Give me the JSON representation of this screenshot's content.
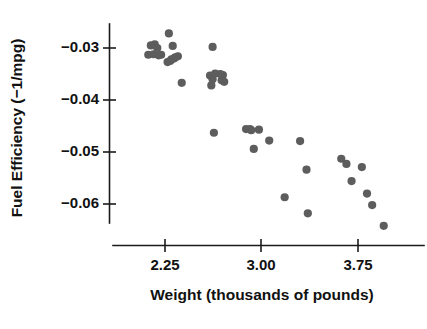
{
  "chart_data": {
    "type": "scatter",
    "title": "",
    "xlabel": "Weight (thousands of pounds)",
    "ylabel": "Fuel Efficiency (−1/mpg)",
    "xlim": [
      2.05,
      4.12
    ],
    "ylim": [
      -0.0665,
      -0.0265
    ],
    "xticks": [
      2.25,
      3.0,
      3.75
    ],
    "xticklabels": [
      "2.25",
      "3.00",
      "3.75"
    ],
    "yticks": [
      -0.03,
      -0.04,
      -0.05,
      -0.06
    ],
    "yticklabels": [
      "−0.03",
      "−0.04",
      "−0.05",
      "−0.06"
    ],
    "grid": false,
    "legend": null,
    "marker": "circle",
    "marker_color": "#5d5d5d",
    "marker_size": 7,
    "n_points": 43,
    "x": [
      2.14,
      2.17,
      2.19,
      2.12,
      2.16,
      2.2,
      2.22,
      2.27,
      2.29,
      2.3,
      2.32,
      2.33,
      2.35,
      2.28,
      2.31,
      2.38,
      2.62,
      2.6,
      2.62,
      2.64,
      2.61,
      2.68,
      2.7,
      2.69,
      2.71,
      2.63,
      2.88,
      2.92,
      2.94,
      2.98,
      2.91,
      3.06,
      3.18,
      3.3,
      3.35,
      3.36,
      3.62,
      3.66,
      3.7,
      3.78,
      3.82,
      3.86,
      3.95
    ],
    "y": [
      -0.0295,
      -0.0293,
      -0.03,
      -0.0313,
      -0.0312,
      -0.0314,
      -0.0313,
      -0.0327,
      -0.0325,
      -0.0322,
      -0.032,
      -0.0318,
      -0.0316,
      -0.0272,
      -0.0296,
      -0.0367,
      -0.0298,
      -0.0353,
      -0.036,
      -0.0349,
      -0.0372,
      -0.035,
      -0.0352,
      -0.0362,
      -0.0365,
      -0.0463,
      -0.0456,
      -0.0458,
      -0.0494,
      -0.0457,
      -0.0456,
      -0.0478,
      -0.0587,
      -0.0479,
      -0.0534,
      -0.0618,
      -0.0513,
      -0.0523,
      -0.0556,
      -0.0529,
      -0.058,
      -0.0602,
      -0.0642
    ]
  },
  "axes": {
    "y_title": "Fuel Efficiency (−1/mpg)",
    "x_title": "Weight (thousands of pounds)",
    "y_tick_labels": [
      "−0.03",
      "−0.04",
      "−0.05",
      "−0.06"
    ],
    "x_tick_labels": [
      "2.25",
      "3.00",
      "3.75"
    ]
  },
  "colors": {
    "marker": "#5d5d5d",
    "axis": "#1b1b1b",
    "text": "#111111",
    "background": "#ffffff"
  }
}
